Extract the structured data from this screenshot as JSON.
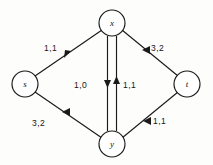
{
  "figure": {
    "type": "flow-network-diagram",
    "background_color": "#fdfdfb",
    "stroke_color": "#1a1a1a",
    "nodes": [
      {
        "id": "s",
        "label": "s",
        "cx": 25,
        "cy": 84,
        "r": 13
      },
      {
        "id": "x",
        "label": "x",
        "cx": 112,
        "cy": 23,
        "r": 13
      },
      {
        "id": "t",
        "label": "t",
        "cx": 187,
        "cy": 84,
        "r": 13
      },
      {
        "id": "y",
        "label": "y",
        "cx": 112,
        "cy": 144,
        "r": 13
      }
    ],
    "edges": [
      {
        "id": "s-x",
        "from": "s",
        "to": "x",
        "label": "1,1",
        "label_x": 44,
        "label_y": 51
      },
      {
        "id": "x-t",
        "from": "x",
        "to": "t",
        "label": "3,2",
        "label_x": 151,
        "label_y": 51
      },
      {
        "id": "s-y",
        "from": "s",
        "to": "y",
        "label": "3,2",
        "label_x": 32,
        "label_y": 126
      },
      {
        "id": "y-t",
        "from": "y",
        "to": "t",
        "label": "1,1",
        "label_x": 153,
        "label_y": 124
      },
      {
        "id": "x-y",
        "from": "x",
        "to": "y",
        "label": "1,0",
        "label_x": 74,
        "label_y": 88
      },
      {
        "id": "y-x",
        "from": "y",
        "to": "x",
        "label": "1,1",
        "label_x": 123,
        "label_y": 88
      }
    ]
  }
}
